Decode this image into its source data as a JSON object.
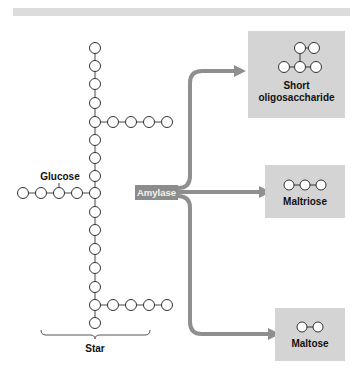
{
  "diagram": {
    "enzyme_label": "Amylase",
    "glucose_label": "Glucose",
    "starch_label": "Star",
    "products": [
      {
        "label_line1": "Short",
        "label_line2": "oligosaccharide"
      },
      {
        "label": "Maltriose"
      },
      {
        "label": "Maltose"
      }
    ],
    "colors": {
      "arrow": "#8f8f8f",
      "product_box": "#d4d4d4",
      "enzyme_box": "#8c8c8c",
      "node_stroke": "#333333",
      "top_bar": "#dcdcdc"
    }
  }
}
